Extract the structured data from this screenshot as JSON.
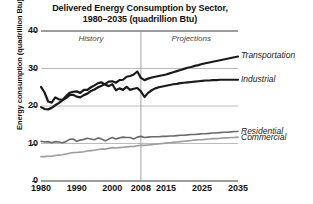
{
  "chart_data": {
    "type": "line",
    "title": "Delivered Energy Consumption by Sector,",
    "title_line2": "1980–2035 (quadrillion Btu)",
    "xlabel": "",
    "ylabel": "Energy consumption (quadrillion Btu)",
    "xlim": [
      1980,
      2035
    ],
    "ylim": [
      0,
      40
    ],
    "grid": true,
    "legend_position": "right-inline",
    "xticks": [
      1980,
      1990,
      2000,
      2008,
      2015,
      2025,
      2035
    ],
    "xtick_labels": [
      "1980",
      "1990",
      "2000",
      "2008",
      "2015",
      "2025",
      "2035"
    ],
    "yticks": [
      0,
      10,
      20,
      30,
      40
    ],
    "ytick_labels": [
      "0",
      "10",
      "20",
      "30",
      "40"
    ],
    "annotations": [
      {
        "text": "History",
        "x": 1994,
        "y": 38
      },
      {
        "text": "Projections",
        "x": 2022,
        "y": 38
      }
    ],
    "divider_x": 2008,
    "series": [
      {
        "name": "Transportation",
        "color": "#1a1a1a",
        "width": 2.2,
        "label_x": 2036,
        "label_y": 33.4,
        "x": [
          1980,
          1981,
          1982,
          1983,
          1984,
          1985,
          1986,
          1987,
          1988,
          1989,
          1990,
          1991,
          1992,
          1993,
          1994,
          1995,
          1996,
          1997,
          1998,
          1999,
          2000,
          2001,
          2002,
          2003,
          2004,
          2005,
          2006,
          2007,
          2008,
          2009,
          2010,
          2011,
          2012,
          2013,
          2014,
          2015,
          2016,
          2017,
          2018,
          2019,
          2020,
          2021,
          2022,
          2023,
          2024,
          2025,
          2026,
          2027,
          2028,
          2029,
          2030,
          2031,
          2032,
          2033,
          2034,
          2035
        ],
        "y": [
          19.7,
          19.2,
          19.1,
          19.5,
          20.2,
          20.8,
          21.5,
          22.1,
          22.9,
          23.0,
          22.5,
          22.3,
          22.9,
          23.3,
          24.0,
          24.4,
          25.0,
          25.4,
          25.9,
          26.5,
          26.6,
          26.2,
          26.9,
          27.0,
          27.8,
          28.0,
          28.4,
          29.2,
          27.5,
          26.9,
          27.3,
          27.6,
          27.8,
          28.0,
          28.2,
          28.4,
          28.7,
          29.0,
          29.3,
          29.6,
          29.9,
          30.2,
          30.4,
          30.7,
          30.9,
          31.2,
          31.4,
          31.6,
          31.8,
          32.0,
          32.2,
          32.4,
          32.6,
          32.8,
          33.0,
          33.2
        ]
      },
      {
        "name": "Industrial",
        "color": "#1a1a1a",
        "width": 2.2,
        "label_x": 2036,
        "label_y": 27.0,
        "x": [
          1980,
          1981,
          1982,
          1983,
          1984,
          1985,
          1986,
          1987,
          1988,
          1989,
          1990,
          1991,
          1992,
          1993,
          1994,
          1995,
          1996,
          1997,
          1998,
          1999,
          2000,
          2001,
          2002,
          2003,
          2004,
          2005,
          2006,
          2007,
          2008,
          2009,
          2010,
          2011,
          2012,
          2013,
          2014,
          2015,
          2016,
          2017,
          2018,
          2019,
          2020,
          2021,
          2022,
          2023,
          2024,
          2025,
          2026,
          2027,
          2028,
          2029,
          2030,
          2031,
          2032,
          2033,
          2034,
          2035
        ],
        "y": [
          25.1,
          23.6,
          21.2,
          20.9,
          22.3,
          21.8,
          21.6,
          22.6,
          23.5,
          23.8,
          23.9,
          23.5,
          24.3,
          24.3,
          25.0,
          25.5,
          26.1,
          26.3,
          25.7,
          25.3,
          25.8,
          24.2,
          24.7,
          24.3,
          25.1,
          24.3,
          24.6,
          24.8,
          23.9,
          22.4,
          23.5,
          24.2,
          24.7,
          25.0,
          25.2,
          25.4,
          25.6,
          25.8,
          25.9,
          26.1,
          26.2,
          26.3,
          26.4,
          26.5,
          26.6,
          26.7,
          26.8,
          26.8,
          26.9,
          26.9,
          27.0,
          27.0,
          27.0,
          27.0,
          27.0,
          27.0
        ]
      },
      {
        "name": "Residential",
        "color": "#6b6b6b",
        "width": 1.6,
        "label_x": 2036,
        "label_y": 13.2,
        "x": [
          1980,
          1981,
          1982,
          1983,
          1984,
          1985,
          1986,
          1987,
          1988,
          1989,
          1990,
          1991,
          1992,
          1993,
          1994,
          1995,
          1996,
          1997,
          1998,
          1999,
          2000,
          2001,
          2002,
          2003,
          2004,
          2005,
          2006,
          2007,
          2008,
          2009,
          2010,
          2011,
          2012,
          2013,
          2014,
          2015,
          2016,
          2017,
          2018,
          2019,
          2020,
          2021,
          2022,
          2023,
          2024,
          2025,
          2026,
          2027,
          2028,
          2029,
          2030,
          2031,
          2032,
          2033,
          2034,
          2035
        ],
        "y": [
          10.6,
          10.4,
          10.5,
          10.2,
          10.5,
          10.4,
          10.2,
          10.5,
          11.1,
          11.2,
          10.6,
          10.9,
          11.1,
          11.4,
          11.2,
          11.0,
          11.5,
          11.2,
          10.7,
          11.2,
          11.6,
          11.2,
          11.5,
          11.7,
          11.6,
          11.6,
          11.2,
          11.7,
          11.9,
          11.6,
          11.7,
          11.8,
          11.8,
          11.8,
          11.9,
          11.9,
          12.0,
          12.0,
          12.1,
          12.2,
          12.2,
          12.3,
          12.4,
          12.4,
          12.5,
          12.6,
          12.6,
          12.7,
          12.8,
          12.8,
          12.9,
          13.0,
          13.0,
          13.1,
          13.2,
          13.2
        ]
      },
      {
        "name": "Commercial",
        "color": "#9d9d9d",
        "width": 1.6,
        "label_x": 2036,
        "label_y": 11.6,
        "x": [
          1980,
          1981,
          1982,
          1983,
          1984,
          1985,
          1986,
          1987,
          1988,
          1989,
          1990,
          1991,
          1992,
          1993,
          1994,
          1995,
          1996,
          1997,
          1998,
          1999,
          2000,
          2001,
          2002,
          2003,
          2004,
          2005,
          2006,
          2007,
          2008,
          2009,
          2010,
          2011,
          2012,
          2013,
          2014,
          2015,
          2016,
          2017,
          2018,
          2019,
          2020,
          2021,
          2022,
          2023,
          2024,
          2025,
          2026,
          2027,
          2028,
          2029,
          2030,
          2031,
          2032,
          2033,
          2034,
          2035
        ],
        "y": [
          6.5,
          6.5,
          6.6,
          6.6,
          6.8,
          6.9,
          7.0,
          7.2,
          7.4,
          7.6,
          7.6,
          7.7,
          7.8,
          8.0,
          8.1,
          8.2,
          8.4,
          8.5,
          8.5,
          8.7,
          8.9,
          8.8,
          8.9,
          9.0,
          9.1,
          9.2,
          9.2,
          9.4,
          9.5,
          9.5,
          9.6,
          9.7,
          9.8,
          9.9,
          10.0,
          10.1,
          10.2,
          10.3,
          10.4,
          10.5,
          10.6,
          10.7,
          10.8,
          10.9,
          11.0,
          11.0,
          11.1,
          11.2,
          11.3,
          11.3,
          11.4,
          11.5,
          11.5,
          11.6,
          11.6,
          11.7
        ]
      }
    ]
  }
}
